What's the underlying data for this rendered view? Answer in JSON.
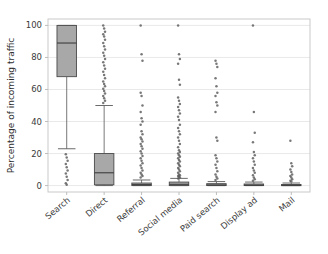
{
  "chart_data": {
    "type": "boxplot",
    "title": "",
    "xlabel": "",
    "ylabel": "Percentage of incoming traffic",
    "ylim": [
      -4,
      104
    ],
    "yticks": [
      0,
      20,
      40,
      60,
      80,
      100
    ],
    "ytick_labels": [
      "0",
      "20",
      "40",
      "60",
      "80",
      "100"
    ],
    "grid": true,
    "legend": null,
    "categories": [
      "Search",
      "Direct",
      "Referral",
      "Social media",
      "Paid search",
      "Display ad",
      "Mail"
    ],
    "series": [
      {
        "name": "Search",
        "q1": 68,
        "median": 89,
        "q3": 100,
        "whisker_low": 23,
        "whisker_high": 100,
        "fliers": [
          19.5,
          17.5,
          15.5,
          13.5,
          11.5,
          9.5,
          7.5,
          5.5,
          3.5,
          1.5,
          0.5
        ]
      },
      {
        "name": "Direct",
        "q1": 0.5,
        "median": 8,
        "q3": 20,
        "whisker_low": 0,
        "whisker_high": 50,
        "fliers": [
          100,
          98,
          96,
          94.5,
          93,
          91,
          89,
          87,
          85,
          83,
          81,
          79,
          77,
          75,
          73,
          71,
          69,
          67,
          65,
          63.5,
          62,
          60.5,
          59,
          57.5,
          56,
          54.5,
          53,
          51.5
        ]
      },
      {
        "name": "Referral",
        "q1": 0,
        "median": 0.6,
        "q3": 1.6,
        "whisker_low": 0,
        "whisker_high": 3.5,
        "fliers": [
          100,
          82,
          78,
          58,
          56,
          50,
          46,
          42,
          40,
          38,
          34,
          32,
          30,
          29,
          27.5,
          26,
          24.5,
          23,
          21.5,
          20,
          18.5,
          17,
          15.5,
          14,
          12.5,
          11,
          9.5,
          8,
          7,
          6,
          5
        ]
      },
      {
        "name": "Social media",
        "q1": 0,
        "median": 0.8,
        "q3": 2.2,
        "whisker_low": 0,
        "whisker_high": 4.5,
        "fliers": [
          100,
          82,
          79,
          76,
          66,
          63,
          55,
          53,
          51,
          49,
          47,
          45,
          43,
          41,
          38,
          36,
          34,
          32,
          30,
          28,
          26,
          24,
          22,
          21,
          20,
          19,
          18,
          17,
          16,
          15,
          14,
          13,
          12,
          11,
          10,
          9,
          8,
          7,
          6.5,
          6,
          5.5,
          5,
          4.5
        ]
      },
      {
        "name": "Paid search",
        "q1": 0,
        "median": 0.4,
        "q3": 1.2,
        "whisker_low": 0,
        "whisker_high": 2.5,
        "fliers": [
          78,
          76,
          74,
          67,
          62,
          58,
          56,
          52,
          50,
          46,
          30,
          28,
          19,
          17,
          15,
          13,
          11,
          9,
          7,
          5.5,
          4.5,
          3.5
        ]
      },
      {
        "name": "Display ad",
        "q1": 0,
        "median": 0.3,
        "q3": 1.0,
        "whisker_low": 0,
        "whisker_high": 2.2,
        "fliers": [
          100,
          46,
          33,
          27,
          21,
          19,
          17,
          15,
          13,
          11,
          9.5,
          8,
          6.5,
          5,
          4,
          3
        ]
      },
      {
        "name": "Mail",
        "q1": 0,
        "median": 0.2,
        "q3": 0.7,
        "whisker_low": 0,
        "whisker_high": 1.6,
        "fliers": [
          28,
          14,
          12,
          10,
          8.5,
          7,
          6,
          5,
          4,
          3,
          2.5
        ]
      }
    ]
  }
}
